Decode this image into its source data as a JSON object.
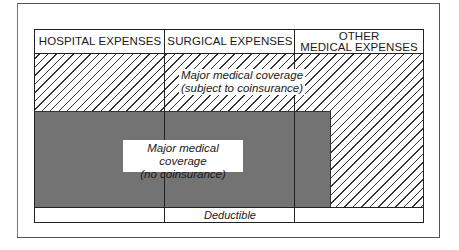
{
  "diagram": {
    "columns": [
      {
        "label": "HOSPITAL EXPENSES"
      },
      {
        "label": "SURGICAL EXPENSES"
      },
      {
        "label_line1": "OTHER",
        "label_line2": "MEDICAL EXPENSES"
      }
    ],
    "regions": {
      "coinsurance": {
        "line1": "Major medical coverage",
        "line2": "(subject to coinsurance)",
        "pattern": "diagonal-hatch"
      },
      "no_coinsurance": {
        "line1": "Major medical coverage",
        "line2": "(no coinsurance)",
        "pattern": "stipple"
      },
      "deductible": {
        "label": "Deductible"
      }
    },
    "colors": {
      "line": "#222222",
      "stipple": "#b8b8b8",
      "background": "#ffffff"
    }
  }
}
